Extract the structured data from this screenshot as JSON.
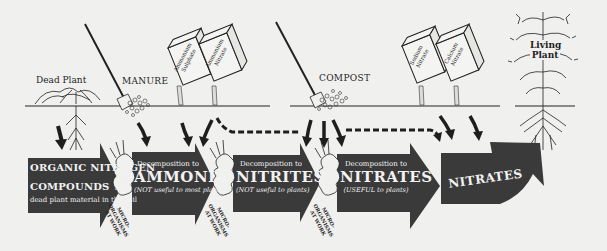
{
  "diagram": {
    "colors": {
      "background": "#f0f0ee",
      "arrow_fill": "#3a3a3a",
      "ink": "#1e1e1e",
      "box_text": "#f2f2f2"
    },
    "surface_labels": {
      "dead_plant": "Dead Plant",
      "manure": "MANURE",
      "compost": "COMPOST",
      "living_plant_line1": "Living",
      "living_plant_line2": "Plant"
    },
    "fertilizer_bags": [
      {
        "line1": "Ammonium",
        "line2": "Sulphate"
      },
      {
        "line1": "Ammonium",
        "line2": "Nitrate"
      },
      {
        "line1": "Sodium",
        "line2": "Nitrate"
      },
      {
        "line1": "Calcium",
        "line2": "Nitrate"
      }
    ],
    "stages": [
      {
        "title_line1": "ORGANIC NITROGEN",
        "title_line2": "COMPOUNDS",
        "title_suffix": "from",
        "subtitle": "dead plant material in the soil"
      },
      {
        "prefix": "Decomposition to",
        "title": "AMMONIA",
        "note": "(NOT useful to most plants)"
      },
      {
        "prefix": "Decomposition to",
        "title": "NITRITES",
        "note": "(NOT useful to plants)"
      },
      {
        "prefix": "Decomposition to",
        "title": "NITRATES",
        "note": "(USEFUL to plants)"
      },
      {
        "title": "NITRATES"
      }
    ],
    "microorganisms": [
      {
        "line1": "MICRO-",
        "line2": "ORGANISMS",
        "line3": "AT WORK"
      },
      {
        "line1": "MICRO-",
        "line2": "ORGANISMS",
        "line3": "AT WORK"
      },
      {
        "line1": "MICRO-",
        "line2": "ORGANISMS",
        "line3": "AT WORK"
      }
    ]
  }
}
